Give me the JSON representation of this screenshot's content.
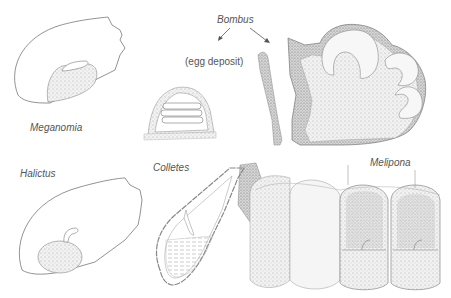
{
  "figure": {
    "labels": {
      "meganomia": "Meganomia",
      "bombus": "Bombus",
      "egg_deposit": "(egg deposit)",
      "halictus": "Halictus",
      "colletes": "Colletes",
      "melipona": "Melipona"
    },
    "colors": {
      "line": "#666666",
      "stipple": "#bdbdbd",
      "dark_stipple": "#8a8a8a",
      "text": "#555555"
    }
  }
}
